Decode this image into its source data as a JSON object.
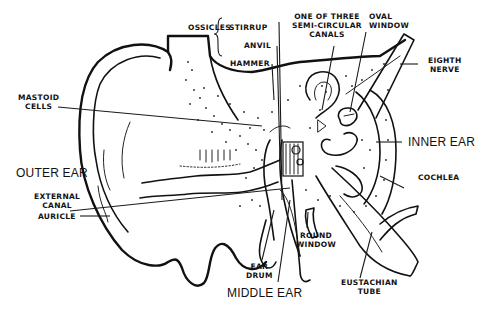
{
  "diagram": {
    "regions": {
      "outer_ear": "OUTER EAR",
      "middle_ear": "MIDDLE EAR",
      "inner_ear": "INNER EAR"
    },
    "labels": {
      "ossicles": "OSSICLES",
      "stirrup": "STIRRUP",
      "anvil": "ANVIL",
      "hammer": "HAMMER",
      "semicircular_line1": "ONE OF THREE",
      "semicircular_line2": "SEMI-CIRCULAR",
      "semicircular_line3": "CANALS",
      "oval_line1": "OVAL",
      "oval_line2": "WINDOW",
      "eighth_line1": "EIGHTH",
      "eighth_line2": "NERVE",
      "mastoid_line1": "MASTOID",
      "mastoid_line2": "CELLS",
      "external_line1": "EXTERNAL",
      "external_line2": "CANAL",
      "auricle": "AURICLE",
      "cochlea": "COCHLEA",
      "round_line1": "ROUND",
      "round_line2": "WINDOW",
      "eardrum_line1": "EAR",
      "eardrum_line2": "DRUM",
      "eustachian_line1": "EUSTACHIAN",
      "eustachian_line2": "TUBE"
    },
    "colors": {
      "ink": "#111111",
      "paper": "#ffffff"
    }
  }
}
